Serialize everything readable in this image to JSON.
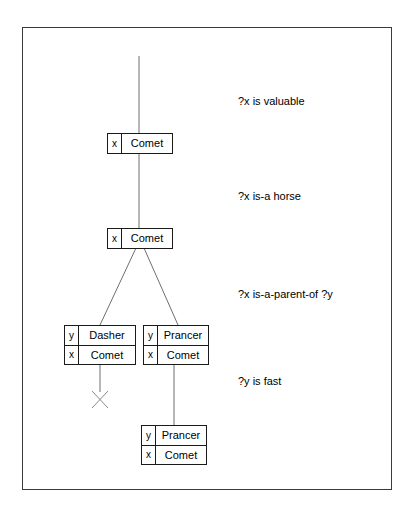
{
  "figure": {
    "frame": {
      "border_color": "#3a3a3a"
    },
    "line_color": "#6e6e6e",
    "fail_mark_color": "#8a8a8a",
    "box_border_color": "#1a1a1a"
  },
  "goals": [
    {
      "id": "goal-valuable",
      "text": "?x is valuable"
    },
    {
      "id": "goal-is-a-horse",
      "text": "?x is-a horse"
    },
    {
      "id": "goal-is-a-parent-of",
      "text": "?x is-a-parent-of ?y"
    },
    {
      "id": "goal-is-fast",
      "text": "?y is fast"
    }
  ],
  "nodes": [
    {
      "id": "node-comet-valuable",
      "rows": [
        {
          "variable": "x",
          "value": "Comet"
        }
      ]
    },
    {
      "id": "node-comet-horse",
      "rows": [
        {
          "variable": "x",
          "value": "Comet"
        }
      ]
    },
    {
      "id": "node-dasher",
      "rows": [
        {
          "variable": "y",
          "value": "Dasher"
        },
        {
          "variable": "x",
          "value": "Comet"
        }
      ]
    },
    {
      "id": "node-prancer",
      "rows": [
        {
          "variable": "y",
          "value": "Prancer"
        },
        {
          "variable": "x",
          "value": "Comet"
        }
      ]
    },
    {
      "id": "node-prancer-fast",
      "rows": [
        {
          "variable": "y",
          "value": "Prancer"
        },
        {
          "variable": "x",
          "value": "Comet"
        }
      ]
    }
  ],
  "fail_marks": [
    {
      "id": "fail-dasher",
      "symbol": "X"
    }
  ]
}
